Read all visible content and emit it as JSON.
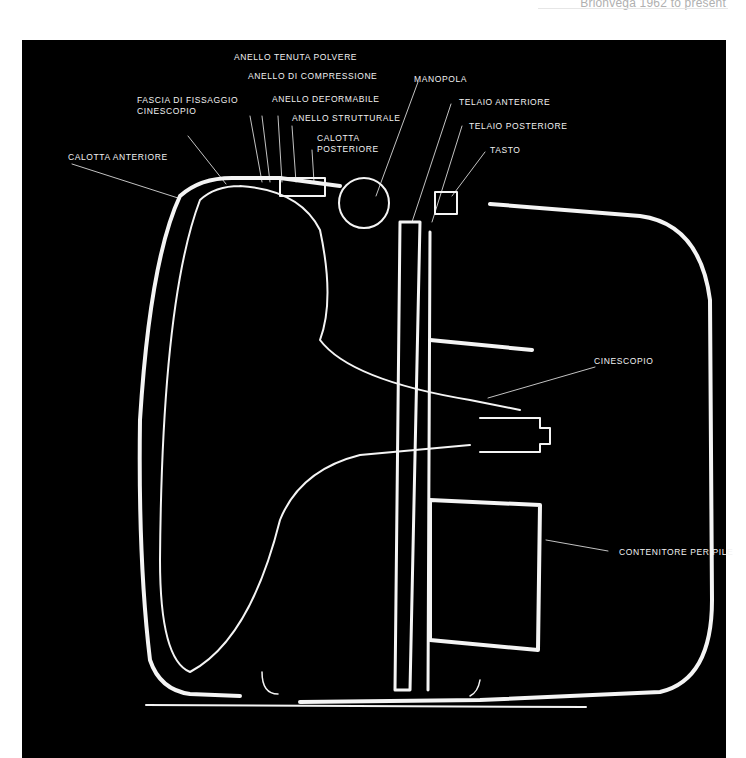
{
  "caption": "Brionvega 1962 to present",
  "diagram": {
    "labels": [
      {
        "id": "anello-tenuta-polvere",
        "text": "ANELLO TENUTA POLVERE"
      },
      {
        "id": "anello-di-compressione",
        "text": "ANELLO DI COMPRESSIONE"
      },
      {
        "id": "fascia-di-fissaggio",
        "text": "FASCIA DI FISSAGGIO"
      },
      {
        "id": "cinescopio-sub",
        "text": "CINESCOPIO"
      },
      {
        "id": "anello-deformabile",
        "text": "ANELLO DEFORMABILE"
      },
      {
        "id": "anello-strutturale",
        "text": "ANELLO STRUTTURALE"
      },
      {
        "id": "calotta",
        "text": "CALOTTA"
      },
      {
        "id": "posteriore",
        "text": "POSTERIORE"
      },
      {
        "id": "calotta-anteriore",
        "text": "CALOTTA ANTERIORE"
      },
      {
        "id": "manopola",
        "text": "MANOPOLA"
      },
      {
        "id": "telaio-anteriore",
        "text": "TELAIO ANTERIORE"
      },
      {
        "id": "telaio-posteriore",
        "text": "TELAIO POSTERIORE"
      },
      {
        "id": "tasto",
        "text": "TASTO"
      },
      {
        "id": "cinescopio",
        "text": "CINESCOPIO"
      },
      {
        "id": "contenitore-per-pile",
        "text": "CONTENITORE PER PILE"
      }
    ]
  }
}
